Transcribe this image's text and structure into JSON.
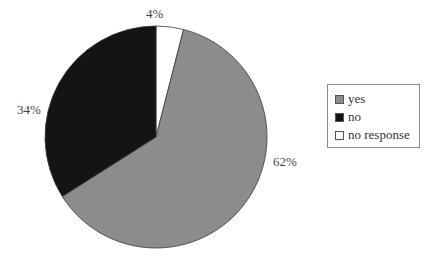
{
  "chart_data": {
    "type": "pie",
    "title": "",
    "categories": [
      "yes",
      "no",
      "no response"
    ],
    "values": [
      62,
      34,
      4
    ],
    "unit": "%",
    "labels": [
      "62%",
      "34%",
      "4%"
    ],
    "colors": [
      "#8c8c8c",
      "#141414",
      "#ffffff"
    ],
    "start_angle_deg": 0,
    "direction": "clockwise-from-12-oclock: no response, yes, no",
    "legend_position": "right"
  },
  "legend": {
    "items": [
      {
        "label": "yes",
        "color": "#8c8c8c"
      },
      {
        "label": "no",
        "color": "#141414"
      },
      {
        "label": "no response",
        "color": "#ffffff"
      }
    ]
  },
  "slice_labels": {
    "yes": "62%",
    "no": "34%",
    "no_response": "4%"
  }
}
